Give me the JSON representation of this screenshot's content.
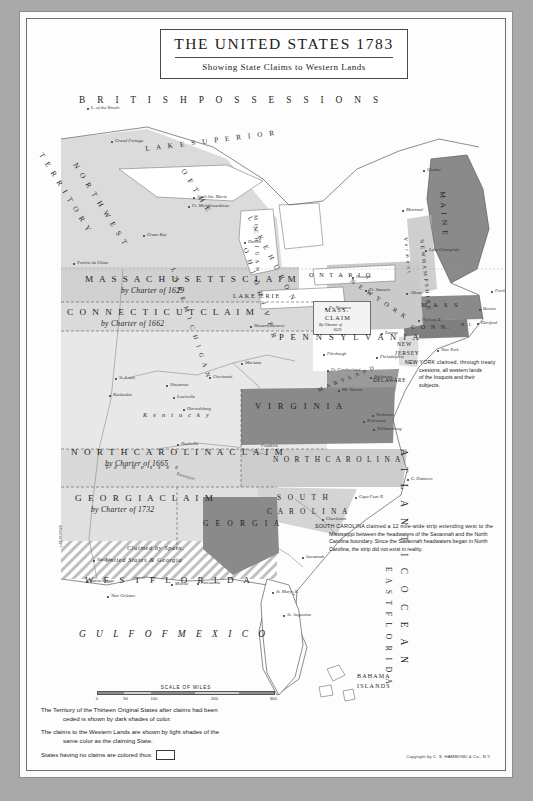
{
  "sheet": {
    "title": "THE UNITED STATES 1783",
    "subtitle": "Showing State Claims to Western Lands",
    "copyright": "Copyright by C. S. HAMMOND & Co., N.Y."
  },
  "regions": {
    "british": "B R I T I S H   P O S S E S S I O N S",
    "louisiana": "L O U I S I A N A",
    "atlantic": "A T L A N T I C   O C E A N",
    "gulf": "G U L F   O F   M E X I C O",
    "bahama_1": "BAHAMA",
    "bahama_2": "ISLANDS",
    "east_florida": "E A S T   F L O R I D A",
    "west_florida": "W E S T   F L O R I D A"
  },
  "lakes": {
    "superior": "L A K E   S U P E R I O R",
    "huron": "L A K E   H U R O N",
    "michigan": "L A K E  M I C H I G A N",
    "erie": "LAKE ERIE",
    "ontario": "O N T A R I O",
    "ohio_river": "O H I O   R I V E R"
  },
  "claims": [
    {
      "id": "northwest-territory",
      "line1": "T E R R I T O R Y",
      "line2": "N O R T H W E S T",
      "line3": "O F  T H E"
    },
    {
      "id": "massachusetts-claim",
      "title": "M A S S A C H U S E T T S   C L A I M",
      "subtitle": "by Charter of 1629"
    },
    {
      "id": "connecticut-claim",
      "title": "C O N N E C T I C U T   C L A I M",
      "subtitle": "by Charter of 1662"
    },
    {
      "id": "north-carolina-claim",
      "title": "N O R T H  C A R O L I N A  C L A I M",
      "subtitle": "by Charter of 1665"
    },
    {
      "id": "georgia-claim",
      "title": "G E O R G I A   C L A I M",
      "subtitle": "by Charter of 1732"
    },
    {
      "id": "mass-claim-inset",
      "title_1": "MASS.",
      "title_2": "CLAIM",
      "subtitle_1": "By Charter of",
      "subtitle_2": "1629"
    },
    {
      "id": "spain-claim",
      "line1": "Claimed by Spain,",
      "line2": "United States & Georgia"
    }
  ],
  "states": {
    "maine": "M A I N E",
    "vermont": "V e r m o n t",
    "new_hampshire": "N E W  H A M P S H I R E",
    "massachusetts": "M A S S",
    "connecticut": "C O N N.",
    "rhode_island": "R. I.",
    "new_york": "N E W  Y O R K",
    "pennsylvania": "P E N N S Y L V A N I A",
    "new_jersey_1": "NEW",
    "new_jersey_2": "JERSEY",
    "delaware": "DELAWARE",
    "maryland": "M A R Y L A N D",
    "virginia": "V I R G I N I A",
    "north_carolina": "N O R T H  C A R O L I N A",
    "south_carolina_1": "S O U T H",
    "south_carolina_2": "C A R O L I N A",
    "georgia": "G E O R G I A",
    "kentucky": "K e n t u c k y",
    "tennessee": "T e n n e s s e e",
    "tennessee_river": "Tennessee",
    "franklin": "Franklin",
    "michigan": "M I C H I G A N",
    "mississippi_r": "Mississippi",
    "ohio_r2": "Ohio R."
  },
  "cities": [
    {
      "name": "Grand Portage",
      "x": 86,
      "y": 121
    },
    {
      "name": "L. of the Woods",
      "x": 62,
      "y": 88
    },
    {
      "name": "Sault Ste. Marie",
      "x": 168,
      "y": 177
    },
    {
      "name": "Ft. Michilimackinac",
      "x": 163,
      "y": 186
    },
    {
      "name": "Green Bay",
      "x": 118,
      "y": 215
    },
    {
      "name": "Prairie du Chien",
      "x": 48,
      "y": 243
    },
    {
      "name": "Detroit",
      "x": 219,
      "y": 222
    },
    {
      "name": "Ft. Niagara",
      "x": 300,
      "y": 288
    },
    {
      "name": "Oswego",
      "x": 327,
      "y": 257
    },
    {
      "name": "Albany",
      "x": 381,
      "y": 273
    },
    {
      "name": "Quebec",
      "x": 398,
      "y": 150
    },
    {
      "name": "Montreal",
      "x": 377,
      "y": 190
    },
    {
      "name": "Portland",
      "x": 466,
      "y": 271
    },
    {
      "name": "Boston",
      "x": 454,
      "y": 289
    },
    {
      "name": "Hartford",
      "x": 452,
      "y": 303
    },
    {
      "name": "New York",
      "x": 412,
      "y": 330
    },
    {
      "name": "Philadelphia",
      "x": 351,
      "y": 337
    },
    {
      "name": "Easton",
      "x": 356,
      "y": 313
    },
    {
      "name": "Pittsburgh",
      "x": 298,
      "y": 334
    },
    {
      "name": "Ft. Cumberland",
      "x": 302,
      "y": 350
    },
    {
      "name": "Baltimore",
      "x": 345,
      "y": 357
    },
    {
      "name": "Mt. Vernon",
      "x": 313,
      "y": 370
    },
    {
      "name": "Richmond",
      "x": 338,
      "y": 401
    },
    {
      "name": "Williamsburg",
      "x": 348,
      "y": 409
    },
    {
      "name": "Yorktown",
      "x": 347,
      "y": 395
    },
    {
      "name": "St. Louis",
      "x": 90,
      "y": 358
    },
    {
      "name": "Kaskaskia",
      "x": 84,
      "y": 375
    },
    {
      "name": "Vincennes",
      "x": 141,
      "y": 365
    },
    {
      "name": "Louisville",
      "x": 148,
      "y": 377
    },
    {
      "name": "Harrodsburg",
      "x": 158,
      "y": 389
    },
    {
      "name": "Cincinnati",
      "x": 184,
      "y": 357
    },
    {
      "name": "Marietta",
      "x": 216,
      "y": 343
    },
    {
      "name": "Nashville",
      "x": 152,
      "y": 424
    },
    {
      "name": "Charleston",
      "x": 297,
      "y": 499
    },
    {
      "name": "Savannah",
      "x": 277,
      "y": 537
    },
    {
      "name": "Natchez",
      "x": 68,
      "y": 540
    },
    {
      "name": "Baton Rouge",
      "x": 61,
      "y": 561
    },
    {
      "name": "New Orleans",
      "x": 82,
      "y": 576
    },
    {
      "name": "Mobile",
      "x": 146,
      "y": 564
    },
    {
      "name": "Pensacola",
      "x": 172,
      "y": 563
    },
    {
      "name": "St. Augustine",
      "x": 258,
      "y": 595
    },
    {
      "name": "St. Marys R.",
      "x": 247,
      "y": 572
    },
    {
      "name": "C. Hatteras",
      "x": 382,
      "y": 459
    },
    {
      "name": "Cape Fear R.",
      "x": 330,
      "y": 477
    },
    {
      "name": "Western Reserve",
      "x": 225,
      "y": 306
    },
    {
      "name": "Lake Champlain",
      "x": 400,
      "y": 230
    },
    {
      "name": "Hudson R.",
      "x": 393,
      "y": 300
    },
    {
      "name": "Ft. Stanwix",
      "x": 340,
      "y": 270
    }
  ],
  "notes": [
    {
      "id": "new-york-note",
      "lines": [
        "NEW YORK claimed, through treaty",
        "cessions, all western lands",
        "of the Iroquois and their",
        "subjects."
      ]
    },
    {
      "id": "south-carolina-note",
      "lines": [
        "SOUTH CAROLINA claimed a 12 mile-wide strip extending west to the",
        "Mississippi between the headwaters of the Savannah and the North",
        "Carolina boundary. Since the Savannah headwaters began in North",
        "Carolina, the strip did not exist in reality."
      ]
    }
  ],
  "legend": {
    "scale_title": "SCALE OF MILES",
    "scale_ticks": [
      "0",
      "50",
      "100",
      "200",
      "300"
    ],
    "lines": [
      "The Territory of the Thirteen Original States after claims had been",
      "ceded is shown by dark shades of color.",
      "The claims to the Western Lands are shown by light shades of the",
      "same color as the claiming State."
    ],
    "no_claim_label": "States having no claims are colored thus:"
  },
  "colors": {
    "paper": "#fbfbfa",
    "page_background": "#a9a9a9",
    "dark_state": "#8a8a8a",
    "light_claim": "#c9c9c9",
    "water": "#ffffff",
    "ink": "#1f1f1f"
  },
  "chart_data": {
    "type": "map",
    "title": "THE UNITED STATES 1783",
    "subtitle": "Showing State Claims to Western Lands",
    "legend_position": "bottom-left"
  }
}
